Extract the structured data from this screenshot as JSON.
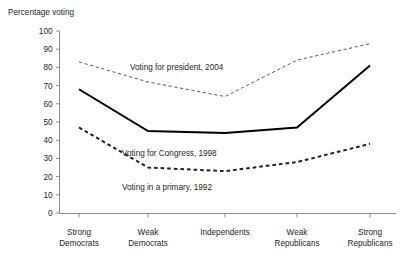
{
  "chart_data": {
    "type": "line",
    "title": "",
    "ylabel": "Percentage voting",
    "xlabel": "",
    "ylim": [
      0,
      100
    ],
    "ytick_step": 10,
    "grid": false,
    "legend_position": "inline-annotations",
    "categories": [
      "Strong Democrats",
      "Weak Democrats",
      "Independents",
      "Weak Republicans",
      "Strong Republicans"
    ],
    "category_lines": [
      [
        "Strong",
        "Democrats"
      ],
      [
        "Weak",
        "Democrats"
      ],
      [
        "Independents"
      ],
      [
        "Weak",
        "Republicans"
      ],
      [
        "Strong",
        "Republicans"
      ]
    ],
    "yticks": [
      0,
      10,
      20,
      30,
      40,
      50,
      60,
      70,
      80,
      90,
      100
    ],
    "series": [
      {
        "name": "Voting for president, 2004",
        "style": "fine-dashed",
        "color": "#58595b",
        "values": [
          83,
          72,
          64,
          84,
          93
        ],
        "annotation": "Voting for president, 2004"
      },
      {
        "name": "Voting for Congress, 1998",
        "style": "solid",
        "color": "#000000",
        "values": [
          68,
          45,
          44,
          47,
          81
        ],
        "annotation": "Voting for Congress, 1998"
      },
      {
        "name": "Voting in a primary, 1992",
        "style": "bold-dashed",
        "color": "#231f20",
        "values": [
          47,
          25,
          23,
          28,
          38
        ],
        "annotation": "Voting in a primary, 1992"
      }
    ]
  },
  "axis": {
    "y_title": "Percentage voting",
    "y_labels": [
      "100",
      "90",
      "80",
      "70",
      "60",
      "50",
      "40",
      "30",
      "20",
      "10",
      "0"
    ],
    "x_labels": [
      {
        "line1": "Strong",
        "line2": "Democrats"
      },
      {
        "line1": "Weak",
        "line2": "Democrats"
      },
      {
        "line1": "Independents",
        "line2": ""
      },
      {
        "line1": "Weak",
        "line2": "Republicans"
      },
      {
        "line1": "Strong",
        "line2": "Republicans"
      }
    ]
  },
  "annotations": {
    "president": "Voting for president, 2004",
    "congress": "Voting for Congress, 1998",
    "primary": "Voting in a primary, 1992"
  },
  "colors": {
    "axis": "#6d6e71",
    "text": "#231f20",
    "solid_series": "#000000",
    "dotted_series": "#58595b",
    "dashed_series": "#231f20",
    "background": "#ffffff"
  }
}
